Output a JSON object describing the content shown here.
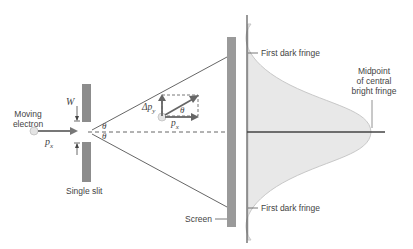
{
  "diagram": {
    "labels": {
      "moving_electron_line1": "Moving",
      "moving_electron_line2": "electron",
      "slit_width": "W",
      "momentum_x_left": "p",
      "momentum_x_left_sub": "x",
      "theta_upper": "θ",
      "theta_lower": "θ",
      "single_slit": "Single slit",
      "delta_py": "Δp",
      "delta_py_sub": "y",
      "theta_vector": "θ",
      "momentum_x_vector": "p",
      "momentum_x_vector_sub": "x",
      "screen": "Screen",
      "first_dark_fringe_top": "First dark fringe",
      "first_dark_fringe_bottom": "First dark fringe",
      "midpoint_line1": "Midpoint",
      "midpoint_line2": "of central",
      "midpoint_line3": "bright fringe"
    },
    "colors": {
      "line": "#444444",
      "slit": "#8c8c8c",
      "screen": "#9a9a9a",
      "fringe_fill": "#e6e6e6",
      "fringe_edge": "#c8c8c8",
      "electron": "#e0e0e0"
    }
  }
}
